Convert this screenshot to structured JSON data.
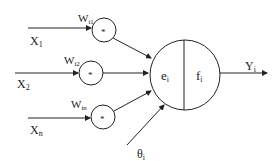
{
  "diagram": {
    "inputs": [
      {
        "label": "X",
        "sub": "1",
        "weight": "W",
        "weight_sub": "i1"
      },
      {
        "label": "X",
        "sub": "2",
        "weight": "W",
        "weight_sub": "i2"
      },
      {
        "label": "X",
        "sub": "n",
        "weight": "W",
        "weight_sub": "in"
      }
    ],
    "multiplier_symbol": "*",
    "neuron": {
      "left_label": "e",
      "left_sub": "i",
      "right_label": "f",
      "right_sub": "i"
    },
    "bias": {
      "label": "θ",
      "sub": "i"
    },
    "output": {
      "label": "Y",
      "sub": "i"
    },
    "colors": {
      "stroke": "#222222",
      "background": "#ffffff"
    }
  }
}
